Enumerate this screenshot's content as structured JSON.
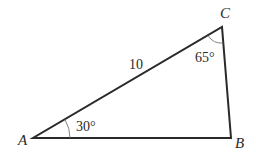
{
  "diagram": {
    "type": "triangle",
    "vertices": {
      "A": {
        "label": "A",
        "x": 33,
        "y": 138
      },
      "B": {
        "label": "B",
        "x": 231,
        "y": 138
      },
      "C": {
        "label": "C",
        "x": 222,
        "y": 27
      }
    },
    "sides": [
      {
        "from": "A",
        "to": "C",
        "label": "10"
      },
      {
        "from": "A",
        "to": "B",
        "label": ""
      },
      {
        "from": "B",
        "to": "C",
        "label": ""
      }
    ],
    "angles": [
      {
        "vertex": "A",
        "label": "30°"
      },
      {
        "vertex": "C",
        "label": "65°"
      }
    ],
    "colors": {
      "stroke": "#2a2a2a",
      "arc": "#555555",
      "background": "#ffffff"
    }
  }
}
